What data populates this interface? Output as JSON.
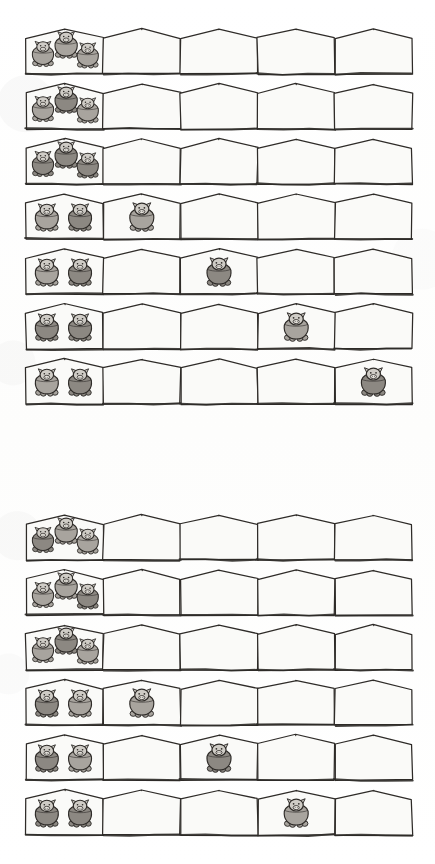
{
  "document": {
    "kind": "scanned-worksheet",
    "title": "",
    "background_color": "#ffffff",
    "ink_color": "#2e2b28",
    "pen_fill_color": "#fafaf8",
    "pig_body_color": "#a8a49e",
    "pig_body_dark_color": "#8c8882",
    "pig_head_color": "#cfccc6",
    "page_width": 435,
    "page_height": 864
  },
  "layout": {
    "pens_per_row": 5,
    "row_left": 26,
    "row_width": 386,
    "pen_width": 77.2,
    "row_height": 48,
    "group_gap": 46
  },
  "groups": [
    {
      "name": "group-one",
      "top": 26,
      "row_pitch": 55,
      "rows": [
        {
          "index": 1,
          "pens": [
            3,
            0,
            0,
            0,
            0
          ],
          "arrangement": "cluster-of-three"
        },
        {
          "index": 2,
          "pens": [
            3,
            0,
            0,
            0,
            0
          ],
          "arrangement": "cluster-of-three"
        },
        {
          "index": 3,
          "pens": [
            3,
            0,
            0,
            0,
            0
          ],
          "arrangement": "cluster-of-three"
        },
        {
          "index": 4,
          "pens": [
            2,
            1,
            0,
            0,
            0
          ],
          "arrangement": "pair-plus-one"
        },
        {
          "index": 5,
          "pens": [
            2,
            0,
            1,
            0,
            0
          ],
          "arrangement": "pair-plus-one"
        },
        {
          "index": 6,
          "pens": [
            2,
            0,
            0,
            1,
            0
          ],
          "arrangement": "pair-plus-one"
        },
        {
          "index": 7,
          "pens": [
            2,
            0,
            0,
            0,
            1
          ],
          "arrangement": "pair-plus-one"
        }
      ]
    },
    {
      "name": "group-two",
      "top": 512,
      "row_pitch": 55,
      "rows": [
        {
          "index": 8,
          "pens": [
            3,
            0,
            0,
            0,
            0
          ],
          "arrangement": "cluster-of-three"
        },
        {
          "index": 9,
          "pens": [
            3,
            0,
            0,
            0,
            0
          ],
          "arrangement": "cluster-of-three"
        },
        {
          "index": 10,
          "pens": [
            3,
            0,
            0,
            0,
            0
          ],
          "arrangement": "cluster-of-three"
        },
        {
          "index": 11,
          "pens": [
            2,
            1,
            0,
            0,
            0
          ],
          "arrangement": "pair-plus-one"
        },
        {
          "index": 12,
          "pens": [
            2,
            0,
            1,
            0,
            0
          ],
          "arrangement": "pair-plus-one"
        },
        {
          "index": 13,
          "pens": [
            2,
            0,
            0,
            1,
            0
          ],
          "arrangement": "pair-plus-one",
          "clipped": true
        }
      ]
    }
  ],
  "totals": {
    "rows_visible": 13,
    "pigs_per_row": 3,
    "total_pens": 65
  }
}
